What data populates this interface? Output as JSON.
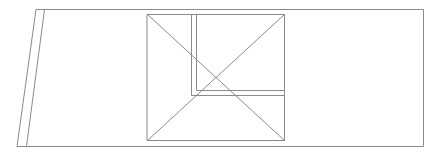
{
  "diagram": {
    "canvas": {
      "width": 441,
      "height": 152,
      "background": "#ffffff"
    },
    "stroke_color": "#8a8a8a",
    "stroke_width": 1,
    "outer_frame": {
      "points": [
        [
          36,
          9
        ],
        [
          423,
          9
        ],
        [
          423,
          146
        ],
        [
          17,
          146
        ]
      ]
    },
    "slanted_strip_inner_edge": {
      "from": [
        44,
        9
      ],
      "to": [
        26,
        146
      ]
    },
    "square": {
      "x": 147,
      "y": 14,
      "width": 137,
      "height": 126
    },
    "diagonals": [
      {
        "from": [
          147,
          14
        ],
        "to": [
          284,
          140
        ]
      },
      {
        "from": [
          284,
          14
        ],
        "to": [
          147,
          140
        ]
      }
    ],
    "inner_l_outer": {
      "points": [
        [
          191,
          14
        ],
        [
          191,
          95
        ],
        [
          284,
          95
        ]
      ]
    },
    "inner_l_inner": {
      "points": [
        [
          196,
          14
        ],
        [
          196,
          90
        ],
        [
          284,
          90
        ]
      ]
    }
  }
}
